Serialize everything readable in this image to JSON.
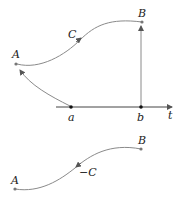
{
  "top_diagram": {
    "point_A": "A",
    "point_B": "B",
    "curve_label": "C",
    "axis_start": "a",
    "axis_end": "b",
    "axis_label": "t"
  },
  "bottom_diagram": {
    "point_A": "A",
    "point_B": "B",
    "curve_label": "−C"
  },
  "colors": {
    "curve": "#8a8a8a",
    "points": "#555555",
    "axis": "#333333",
    "text": "#222222"
  }
}
